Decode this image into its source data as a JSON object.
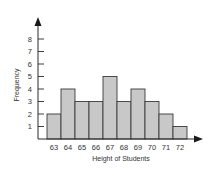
{
  "chart_data": {
    "type": "bar",
    "subtype": "histogram",
    "title": "",
    "xlabel": "Height of Students",
    "ylabel": "Frequency",
    "categories": [
      "63",
      "64",
      "65",
      "66",
      "67",
      "68",
      "69",
      "70",
      "71",
      "72"
    ],
    "values": [
      2,
      4,
      3,
      3,
      5,
      3,
      4,
      3,
      2,
      1
    ],
    "yticks": [
      1,
      2,
      3,
      4,
      5,
      6,
      7,
      8
    ],
    "ylim": [
      0,
      9
    ],
    "grid": false,
    "legend": null,
    "colors": {
      "bar_fill": "#c8c8c8",
      "bar_stroke": "#3a3a3a",
      "axis": "#2a2a2a",
      "text": "#333333"
    }
  }
}
